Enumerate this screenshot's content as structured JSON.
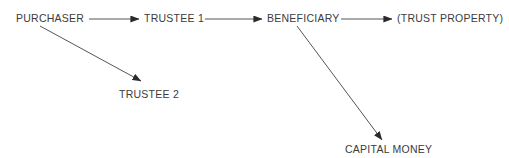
{
  "diagram": {
    "type": "flowchart",
    "background_color": "#ffffff",
    "text_color": "#3b3b3b",
    "line_color": "#55555a",
    "arrowhead_color": "#2b2b2b",
    "nodes": [
      {
        "id": "purchaser",
        "label": "PURCHASER",
        "x": 16,
        "y": 12,
        "row": "top"
      },
      {
        "id": "trustee-1",
        "label": "TRUSTEE 1",
        "x": 144,
        "y": 12,
        "row": "top"
      },
      {
        "id": "beneficiary",
        "label": "BENEFICIARY",
        "x": 267,
        "y": 12,
        "row": "top"
      },
      {
        "id": "trust-property",
        "label": "(TRUST PROPERTY)",
        "x": 397,
        "y": 12,
        "row": "top"
      },
      {
        "id": "trustee-2",
        "label": "TRUSTEE 2",
        "x": 119,
        "y": 88,
        "row": "middle"
      },
      {
        "id": "capital-money",
        "label": "CAPITAL MONEY",
        "x": 345,
        "y": 143,
        "row": "bottom"
      }
    ],
    "edges": [
      {
        "id": "purchaser-to-trustee-1",
        "from": "purchaser",
        "to": "trustee-1",
        "orientation": "horizontal",
        "x1": 89,
        "y1": 19,
        "x2": 139,
        "y2": 19
      },
      {
        "id": "trustee-1-to-beneficiary",
        "from": "trustee-1",
        "to": "beneficiary",
        "orientation": "horizontal",
        "x1": 205,
        "y1": 19,
        "x2": 262,
        "y2": 19
      },
      {
        "id": "beneficiary-to-trust-property",
        "from": "beneficiary",
        "to": "trust-property",
        "orientation": "horizontal",
        "x1": 341,
        "y1": 19,
        "x2": 392,
        "y2": 19
      },
      {
        "id": "purchaser-to-trustee-2",
        "from": "purchaser",
        "to": "trustee-2",
        "orientation": "diagonal",
        "x1": 40,
        "y1": 26,
        "x2": 141,
        "y2": 81
      },
      {
        "id": "beneficiary-to-capital-money",
        "from": "beneficiary",
        "to": "capital-money",
        "orientation": "diagonal",
        "x1": 297,
        "y1": 26,
        "x2": 382,
        "y2": 140
      }
    ]
  }
}
